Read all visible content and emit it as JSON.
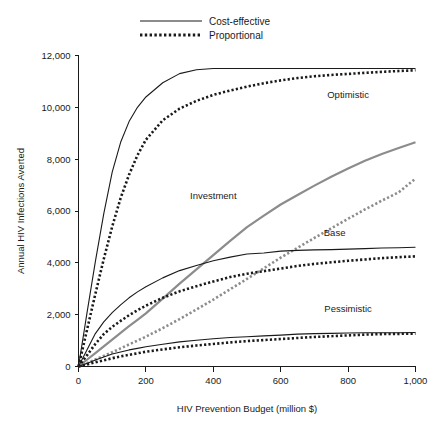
{
  "chart_data": {
    "type": "line",
    "title": "",
    "xlabel": "HIV Prevention Budget (million $)",
    "ylabel": "Annual HIV Infections Averted",
    "xlim": [
      0,
      1000
    ],
    "ylim": [
      0,
      12000
    ],
    "grid": false,
    "xticks": [
      0,
      200,
      400,
      600,
      800,
      1000
    ],
    "xticklabels": [
      "0",
      "200",
      "400",
      "600",
      "800",
      "1,000"
    ],
    "yticks": [
      0,
      2000,
      4000,
      6000,
      8000,
      10000,
      12000
    ],
    "yticklabels": [
      "0",
      "2,000",
      "4,000",
      "6,000",
      "8,000",
      "10,000",
      "12,000"
    ],
    "legend": {
      "position": "top-center",
      "entries": [
        {
          "label": "Cost-effective",
          "style": "solid",
          "color": "#1a1a1a"
        },
        {
          "label": "Proportional",
          "style": "dotted",
          "color": "#1a1a1a"
        }
      ]
    },
    "annotations": [
      {
        "text": "Optimistic",
        "x": 800,
        "y": 10350
      },
      {
        "text": "Investment",
        "x": 400,
        "y": 6450
      },
      {
        "text": "Base",
        "x": 760,
        "y": 5050
      },
      {
        "text": "Pessimistic",
        "x": 800,
        "y": 2100
      }
    ],
    "x": [
      0,
      25,
      50,
      75,
      100,
      125,
      150,
      175,
      200,
      250,
      300,
      350,
      400,
      450,
      500,
      550,
      600,
      650,
      700,
      750,
      800,
      850,
      900,
      950,
      1000
    ],
    "series": [
      {
        "name": "Optimistic - Cost-effective",
        "scenario": "Optimistic",
        "allocation": "Cost-effective",
        "style": "solid",
        "color": "#1a1a1a",
        "values": [
          0,
          2050,
          4050,
          5900,
          7500,
          8650,
          9450,
          10000,
          10400,
          10950,
          11300,
          11450,
          11500,
          11500,
          11500,
          11500,
          11500,
          11500,
          11500,
          11500,
          11500,
          11500,
          11500,
          11500,
          11500
        ]
      },
      {
        "name": "Optimistic - Proportional",
        "scenario": "Optimistic",
        "allocation": "Proportional",
        "style": "dotted",
        "color": "#1a1a1a",
        "values": [
          0,
          1400,
          2800,
          4150,
          5400,
          6500,
          7400,
          8150,
          8750,
          9500,
          9950,
          10250,
          10480,
          10650,
          10800,
          10930,
          11040,
          11130,
          11200,
          11250,
          11290,
          11330,
          11370,
          11400,
          11430
        ]
      },
      {
        "name": "Investment - Cost-effective",
        "scenario": "Investment",
        "allocation": "Cost-effective",
        "style": "solid",
        "color": "#8c8c8c",
        "values": [
          0,
          260,
          520,
          780,
          1040,
          1300,
          1560,
          1800,
          2050,
          2620,
          3200,
          3750,
          4300,
          4850,
          5380,
          5820,
          6250,
          6620,
          6980,
          7320,
          7640,
          7940,
          8200,
          8430,
          8650
        ]
      },
      {
        "name": "Investment - Proportional",
        "scenario": "Investment",
        "allocation": "Proportional",
        "style": "dotted",
        "color": "#8c8c8c",
        "values": [
          0,
          130,
          270,
          410,
          550,
          700,
          850,
          1000,
          1150,
          1480,
          1830,
          2200,
          2580,
          2980,
          3380,
          3790,
          4200,
          4580,
          4960,
          5330,
          5700,
          6060,
          6400,
          6720,
          7250
        ]
      },
      {
        "name": "Base - Cost-effective",
        "scenario": "Base",
        "allocation": "Cost-effective",
        "style": "solid",
        "color": "#1a1a1a",
        "values": [
          0,
          640,
          1270,
          1720,
          2080,
          2380,
          2650,
          2880,
          3080,
          3420,
          3700,
          3900,
          4080,
          4220,
          4340,
          4380,
          4450,
          4480,
          4500,
          4510,
          4530,
          4550,
          4570,
          4580,
          4600
        ]
      },
      {
        "name": "Base - Proportional",
        "scenario": "Base",
        "allocation": "Proportional",
        "style": "dotted",
        "color": "#1a1a1a",
        "values": [
          0,
          430,
          870,
          1250,
          1530,
          1760,
          1980,
          2170,
          2350,
          2650,
          2900,
          3100,
          3280,
          3450,
          3580,
          3680,
          3780,
          3880,
          3960,
          4020,
          4080,
          4130,
          4180,
          4220,
          4250
        ]
      },
      {
        "name": "Pessimistic - Cost-effective",
        "scenario": "Pessimistic",
        "allocation": "Cost-effective",
        "style": "solid",
        "color": "#1a1a1a",
        "values": [
          0,
          120,
          250,
          370,
          480,
          560,
          640,
          700,
          760,
          860,
          950,
          1010,
          1070,
          1120,
          1150,
          1180,
          1210,
          1250,
          1270,
          1280,
          1290,
          1300,
          1300,
          1300,
          1310
        ]
      },
      {
        "name": "Pessimistic - Proportional",
        "scenario": "Pessimistic",
        "allocation": "Proportional",
        "style": "dotted",
        "color": "#1a1a1a",
        "values": [
          0,
          80,
          160,
          240,
          320,
          390,
          450,
          510,
          570,
          660,
          740,
          810,
          870,
          930,
          980,
          1020,
          1060,
          1100,
          1140,
          1170,
          1200,
          1230,
          1250,
          1260,
          1270
        ]
      }
    ]
  }
}
